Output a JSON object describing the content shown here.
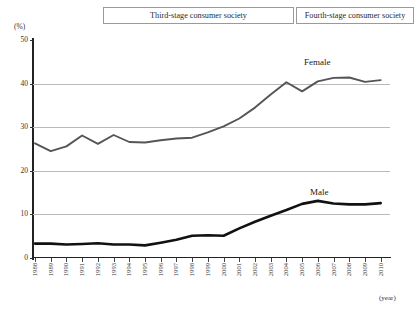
{
  "header": {
    "stage_third": "Third-stage consumer society",
    "stage_fourth": "Fourth-stage consumer society"
  },
  "axis": {
    "y_unit": "(%)",
    "x_unit": "(year)",
    "y_ticks": [
      "50",
      "40",
      "30",
      "20",
      "10",
      "0"
    ]
  },
  "labels": {
    "female": "Female",
    "male": "Male"
  },
  "chart_data": {
    "type": "line",
    "title": "",
    "xlabel": "(year)",
    "ylabel": "(%)",
    "ylim": [
      0,
      50
    ],
    "ytick_values": [
      0,
      10,
      20,
      30,
      40,
      50
    ],
    "grid": true,
    "legend": "inline-annotations",
    "categories": [
      "1988",
      "1989",
      "1990",
      "1991",
      "1992",
      "1993",
      "1994",
      "1995",
      "1996",
      "1997",
      "1998",
      "1999",
      "2000",
      "2001",
      "2002",
      "2003",
      "2004",
      "2005",
      "2006",
      "2007",
      "2008",
      "2009",
      "2010"
    ],
    "series": [
      {
        "name": "Female",
        "color": "#555555",
        "values": [
          26.3,
          24.5,
          25.6,
          28.1,
          26.2,
          28.2,
          26.6,
          26.5,
          27.0,
          27.4,
          27.6,
          28.8,
          30.2,
          32.0,
          34.5,
          37.5,
          40.3,
          38.2,
          40.5,
          41.3,
          41.4,
          40.4,
          40.8
        ]
      },
      {
        "name": "Male",
        "color": "#111111",
        "values": [
          3.3,
          3.3,
          3.1,
          3.2,
          3.4,
          3.1,
          3.1,
          2.9,
          3.5,
          4.2,
          5.1,
          5.2,
          5.1,
          6.8,
          8.3,
          9.7,
          11.0,
          12.4,
          13.1,
          12.5,
          12.3,
          12.3,
          12.6
        ]
      }
    ]
  }
}
